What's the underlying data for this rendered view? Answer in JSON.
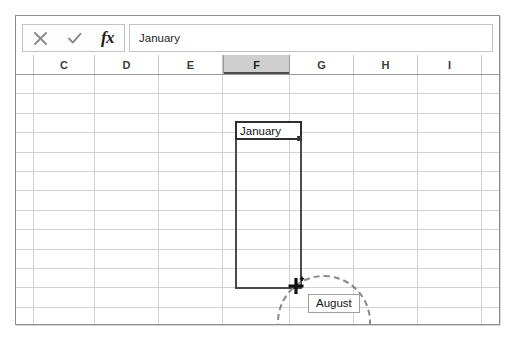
{
  "app": {
    "name": "spreadsheet-autofill-illustration"
  },
  "formula_bar": {
    "cancel_icon": "x-icon",
    "accept_icon": "check-icon",
    "function_icon": "fx-icon",
    "function_label": "fx",
    "input_value": "January",
    "input_placeholder": ""
  },
  "columns": [
    {
      "label": "C",
      "selected": false,
      "width": 61
    },
    {
      "label": "D",
      "selected": false,
      "width": 64
    },
    {
      "label": "E",
      "selected": false,
      "width": 64
    },
    {
      "label": "F",
      "selected": true,
      "width": 67
    },
    {
      "label": "G",
      "selected": false,
      "width": 64
    },
    {
      "label": "H",
      "selected": false,
      "width": 64
    },
    {
      "label": "I",
      "selected": false,
      "width": 64
    }
  ],
  "grid": {
    "row_count": 13,
    "row_height": 19.4,
    "gridline_color": "#d2d2d2"
  },
  "selection": {
    "active_cell_value": "January",
    "active_cell_column": "F",
    "fill_handle_icon": "fill-handle-square",
    "border_color": "#4a4a4a"
  },
  "cursor": {
    "icon": "fill-crosshair-icon"
  },
  "annotation": {
    "shape": "dashed-circle",
    "color": "#8a8a8a"
  },
  "autofill_tooltip": {
    "value": "August"
  },
  "colors": {
    "selected_header_bg": "#cfcfcf",
    "frame_border": "#8d8d8d",
    "text": "#1d1d1d"
  }
}
